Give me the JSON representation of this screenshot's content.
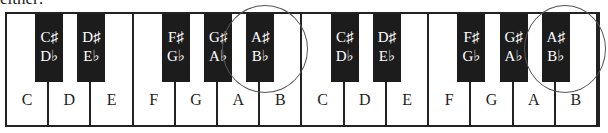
{
  "caption": "either:",
  "white_keys": [
    "C",
    "D",
    "E",
    "F",
    "G",
    "A",
    "B",
    "C",
    "D",
    "E",
    "F",
    "G",
    "A",
    "B"
  ],
  "black_keys": [
    {
      "sharp": "C♯",
      "flat": "D♭",
      "after_white": 0
    },
    {
      "sharp": "D♯",
      "flat": "E♭",
      "after_white": 1
    },
    {
      "sharp": "F♯",
      "flat": "G♭",
      "after_white": 3
    },
    {
      "sharp": "G♯",
      "flat": "A♭",
      "after_white": 4
    },
    {
      "sharp": "A♯",
      "flat": "B♭",
      "after_white": 5
    },
    {
      "sharp": "C♯",
      "flat": "D♭",
      "after_white": 7
    },
    {
      "sharp": "D♯",
      "flat": "E♭",
      "after_white": 8
    },
    {
      "sharp": "F♯",
      "flat": "G♭",
      "after_white": 10
    },
    {
      "sharp": "G♯",
      "flat": "A♭",
      "after_white": 11
    },
    {
      "sharp": "A♯",
      "flat": "B♭",
      "after_white": 12
    }
  ],
  "highlighted": [
    {
      "key": "A♯/B♭",
      "octave": 1
    },
    {
      "key": "A♯/B♭",
      "octave": 2
    }
  ],
  "colors": {
    "black_key": "#1c1c1c",
    "outline": "#222222",
    "circle": "#555555"
  }
}
